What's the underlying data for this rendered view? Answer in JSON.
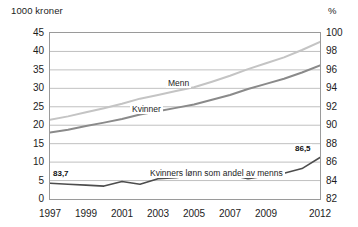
{
  "chart_data": {
    "type": "line",
    "title": "",
    "ylabel_left": "1000 kroner",
    "ylabel_right": "%",
    "xlabel": "",
    "grid": true,
    "legend_position": "inline-labels",
    "x": [
      1997,
      1998,
      1999,
      2000,
      2001,
      2002,
      2003,
      2004,
      2005,
      2006,
      2007,
      2008,
      2009,
      2010,
      2011,
      2012
    ],
    "xtick_labels": [
      "1997",
      "1999",
      "2001",
      "2003",
      "2005",
      "2007",
      "2009",
      "2012"
    ],
    "xticks": [
      1997,
      1999,
      2001,
      2003,
      2005,
      2007,
      2009,
      2012
    ],
    "ylim_left": [
      0,
      45
    ],
    "yticks_left": [
      0,
      5,
      10,
      15,
      20,
      25,
      30,
      35,
      40,
      45
    ],
    "ytick_labels_left": [
      "0",
      "5",
      "10",
      "15",
      "20",
      "25",
      "30",
      "35",
      "40",
      "45"
    ],
    "ylim_right": [
      82,
      100
    ],
    "yticks_right": [
      82,
      84,
      86,
      88,
      90,
      92,
      94,
      96,
      98,
      100
    ],
    "ytick_labels_right": [
      "82",
      "84",
      "86",
      "88",
      "90",
      "92",
      "94",
      "96",
      "98",
      "100"
    ],
    "series": [
      {
        "name": "Menn",
        "axis": "left",
        "color": "#c4c4c4",
        "label_text": "Menn",
        "values": [
          21.5,
          22.4,
          23.5,
          24.6,
          25.8,
          27.2,
          28.2,
          29.3,
          30.3,
          31.8,
          33.4,
          35.2,
          36.8,
          38.4,
          40.4,
          42.6
        ]
      },
      {
        "name": "Kvinner",
        "axis": "left",
        "color": "#8a8a8a",
        "label_text": "Kvinner",
        "values": [
          18.0,
          18.8,
          19.8,
          20.7,
          21.7,
          22.9,
          23.8,
          24.7,
          25.6,
          26.9,
          28.2,
          29.8,
          31.2,
          32.6,
          34.3,
          36.2
        ]
      },
      {
        "name": "Kvinners lønn som andel av menns",
        "axis": "right",
        "color": "#4d4d4d",
        "label_text": "Kvinners lønn som andel av menns",
        "values": [
          83.7,
          83.6,
          83.5,
          83.4,
          83.9,
          83.6,
          84.2,
          84.3,
          84.6,
          84.8,
          84.6,
          84.2,
          84.5,
          84.8,
          85.3,
          86.5
        ]
      }
    ],
    "annotations": [
      {
        "text": "83,7",
        "series": "Kvinners lønn som andel av menns",
        "x": 1997,
        "value": 83.7
      },
      {
        "text": "86,5",
        "series": "Kvinners lønn som andel av menns",
        "x": 2012,
        "value": 86.5
      }
    ]
  }
}
